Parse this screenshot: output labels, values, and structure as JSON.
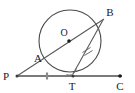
{
  "figure": {
    "width": 135,
    "height": 93,
    "background_color": "#ffffff",
    "stroke_color": "#3b3b3b",
    "line_color": "#6e6e6e",
    "label_color": "#1a1a1a"
  },
  "labels": {
    "P": "P",
    "A": "A",
    "O": "O",
    "B": "B",
    "T": "T",
    "C": "C"
  },
  "geometry": {
    "circle": {
      "name": "circle-O",
      "cx": 70,
      "cy": 41,
      "r": 31
    },
    "points": {
      "P": {
        "x": 17,
        "y": 76
      },
      "A": {
        "x": 47,
        "y": 57
      },
      "O": {
        "x": 69,
        "y": 40
      },
      "B": {
        "x": 101,
        "y": 21
      },
      "T": {
        "x": 73,
        "y": 75
      },
      "C": {
        "x": 120,
        "y": 76
      }
    },
    "label_positions": {
      "P": {
        "x": 4,
        "y": 80
      },
      "A": {
        "x": 36,
        "y": 61
      },
      "O": {
        "x": 63,
        "y": 35
      },
      "B": {
        "x": 108,
        "y": 16
      },
      "T": {
        "x": 69,
        "y": 91
      },
      "C": {
        "x": 116,
        "y": 91
      }
    },
    "segments": [
      {
        "name": "tangent-line-PC",
        "from": "P",
        "to": "C"
      },
      {
        "name": "secant-line-PB",
        "from": "P",
        "to": "B"
      },
      {
        "name": "chord-TB",
        "from": "T",
        "to": "B"
      }
    ],
    "tick_marks": [
      {
        "name": "tick-on-PT",
        "x": 47,
        "y": 76,
        "count": 1
      },
      {
        "name": "tick-on-TB",
        "x": 87,
        "y": 48,
        "count": 2
      }
    ],
    "angle_arc": {
      "name": "angle-arc-at-T",
      "vertex": "T"
    },
    "dots": [
      "P",
      "O",
      "T",
      "C"
    ]
  }
}
